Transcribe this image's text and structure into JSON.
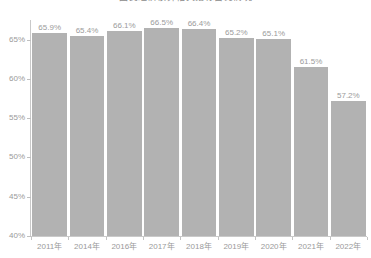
{
  "chart_data": {
    "type": "bar",
    "title": "国民经济核算相关指标占比情况",
    "xlabel": "",
    "ylabel": "",
    "categories": [
      "2011年",
      "2014年",
      "2016年",
      "2017年",
      "2018年",
      "2019年",
      "2020年",
      "2021年",
      "2022年"
    ],
    "values": [
      65.9,
      65.4,
      66.1,
      66.5,
      66.4,
      65.2,
      65.1,
      61.5,
      57.2
    ],
    "data_labels": [
      "65.9%",
      "65.4%",
      "66.1%",
      "66.5%",
      "66.4%",
      "65.2%",
      "65.1%",
      "61.5%",
      "57.2%"
    ],
    "ylim": [
      40,
      67.5
    ],
    "yticks": [
      40,
      45,
      50,
      55,
      60,
      65
    ],
    "ytick_labels": [
      "40%",
      "45%",
      "50%",
      "55%",
      "60%",
      "65%"
    ],
    "grid": false,
    "legend": null,
    "series": [
      {
        "name": "占比",
        "color": "#b2b2b2",
        "values": [
          65.9,
          65.4,
          66.1,
          66.5,
          66.4,
          65.2,
          65.1,
          61.5,
          57.2
        ]
      }
    ]
  },
  "colors": {
    "bar": "#b2b2b2",
    "axis": "#c9c9c9",
    "label_text": "#9a9a9a",
    "background": "#ffffff"
  }
}
